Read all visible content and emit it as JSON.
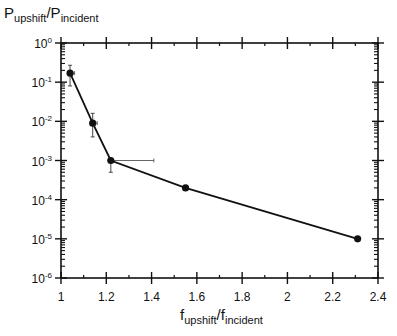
{
  "chart_data": {
    "type": "line",
    "title": "",
    "xlabel": {
      "main": "f",
      "sub": "upshift",
      "sep": "/",
      "main2": "f",
      "sub2": "incident"
    },
    "ylabel": {
      "main": "P",
      "sub": "upshift",
      "sep": "/",
      "main2": "P",
      "sub2": "incident"
    },
    "xscale": "linear",
    "yscale": "log",
    "xlim": [
      1,
      2.4
    ],
    "ylim": [
      1e-06,
      1
    ],
    "x_ticks": [
      1,
      1.2,
      1.4,
      1.6,
      1.8,
      2,
      2.2,
      2.4
    ],
    "x_tick_labels": [
      "1",
      "1.2",
      "1.4",
      "1.6",
      "1.8",
      "2",
      "2.2",
      "2.4"
    ],
    "y_ticks_exp": [
      0,
      -1,
      -2,
      -3,
      -4,
      -5,
      -6
    ],
    "y_tick_labels": [
      "10^0",
      "10^-1",
      "10^-2",
      "10^-3",
      "10^-4",
      "10^-5",
      "10^-6"
    ],
    "grid": false,
    "legend": null,
    "series": [
      {
        "name": "upshift ratio",
        "x": [
          1.04,
          1.14,
          1.22,
          1.55,
          2.31
        ],
        "y": [
          0.17,
          0.009,
          0.001,
          0.0002,
          1e-05
        ],
        "y_err_low": [
          0.08,
          0.004,
          0.0005,
          null,
          null
        ],
        "y_err_high": [
          0.27,
          0.016,
          0.0011,
          null,
          null
        ],
        "x_err_high": [
          1.06,
          1.16,
          1.41,
          null,
          null
        ]
      }
    ]
  }
}
